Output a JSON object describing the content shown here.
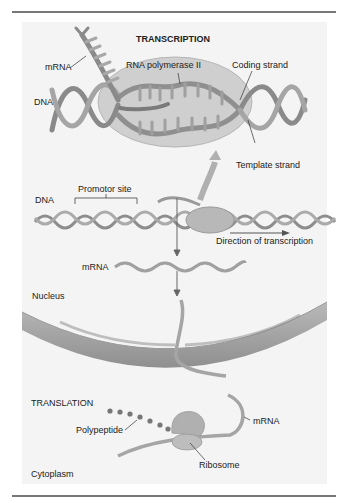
{
  "figure": {
    "transcription": {
      "title": "TRANSCRIPTION",
      "labels": {
        "mrna": "mRNA",
        "rna_polymerase": "RNA polymerase II",
        "coding_strand": "Coding strand",
        "dna": "DNA",
        "template_strand": "Template strand"
      }
    },
    "middle": {
      "dna": "DNA",
      "promotor_site": "Promotor site",
      "direction": "Direction of transcription",
      "mrna": "mRNA"
    },
    "nucleus_label": "Nucleus",
    "translation": {
      "title": "TRANSLATION",
      "polypeptide": "Polypeptide",
      "mrna": "mRNA",
      "ribosome": "Ribosome"
    },
    "cytoplasm_label": "Cytoplasm"
  },
  "colors": {
    "panel": "#f4f4f4",
    "strand": "#9a9a9a",
    "strand_dark": "#7d7d7d",
    "polymerase": "#c9c9c9",
    "membrane": "#a8a8a8",
    "rule": "#777777"
  }
}
